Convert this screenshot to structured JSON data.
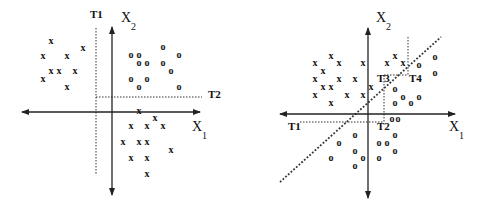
{
  "left_panel": {
    "axis_x_label": "X",
    "axis_x_sub": "1",
    "axis_y_label": "X",
    "axis_y_sub": "2",
    "thresholds": [
      {
        "label": "T1",
        "orientation": "vertical"
      },
      {
        "label": "T2",
        "orientation": "horizontal"
      }
    ],
    "x_markers": [
      [
        51,
        40
      ],
      [
        43,
        55
      ],
      [
        67,
        55
      ],
      [
        83,
        47
      ],
      [
        51,
        70
      ],
      [
        59,
        70
      ],
      [
        75,
        70
      ],
      [
        43,
        78
      ],
      [
        67,
        86
      ],
      [
        139,
        110
      ],
      [
        155,
        117
      ],
      [
        131,
        125
      ],
      [
        147,
        125
      ],
      [
        163,
        125
      ],
      [
        123,
        141
      ],
      [
        139,
        141
      ],
      [
        147,
        141
      ],
      [
        171,
        149
      ],
      [
        131,
        157
      ],
      [
        147,
        157
      ],
      [
        147,
        173
      ]
    ],
    "o_markers": [
      [
        131,
        54
      ],
      [
        139,
        54
      ],
      [
        139,
        62
      ],
      [
        147,
        62
      ],
      [
        163,
        46
      ],
      [
        179,
        54
      ],
      [
        163,
        62
      ],
      [
        171,
        70
      ],
      [
        131,
        78
      ],
      [
        147,
        78
      ],
      [
        139,
        86
      ],
      [
        179,
        86
      ]
    ]
  },
  "right_panel": {
    "axis_x_label": "X",
    "axis_x_sub": "1",
    "axis_y_label": "X",
    "axis_y_sub": "2",
    "thresholds": [
      {
        "label": "T1"
      },
      {
        "label": "T2"
      },
      {
        "label": "T3"
      },
      {
        "label": "T4"
      }
    ],
    "x_markers": [
      [
        315,
        62
      ],
      [
        331,
        55
      ],
      [
        339,
        62
      ],
      [
        323,
        70
      ],
      [
        315,
        78
      ],
      [
        339,
        78
      ],
      [
        355,
        78
      ],
      [
        323,
        86
      ],
      [
        331,
        86
      ],
      [
        315,
        94
      ],
      [
        347,
        94
      ],
      [
        363,
        94
      ],
      [
        331,
        102
      ],
      [
        363,
        62
      ],
      [
        387,
        62
      ],
      [
        395,
        55
      ],
      [
        403,
        62
      ],
      [
        371,
        86
      ]
    ],
    "o_markers": [
      [
        419,
        64
      ],
      [
        435,
        56
      ],
      [
        435,
        72
      ],
      [
        395,
        88
      ],
      [
        403,
        96
      ],
      [
        419,
        96
      ],
      [
        395,
        102
      ],
      [
        411,
        102
      ],
      [
        392,
        118
      ],
      [
        398,
        118
      ],
      [
        355,
        134
      ],
      [
        339,
        142
      ],
      [
        395,
        134
      ],
      [
        379,
        142
      ],
      [
        387,
        142
      ],
      [
        355,
        150
      ],
      [
        395,
        150
      ],
      [
        331,
        157
      ],
      [
        363,
        157
      ],
      [
        379,
        157
      ],
      [
        355,
        165
      ]
    ]
  },
  "marker_symbols": {
    "class_a": "x",
    "class_b": "o"
  }
}
